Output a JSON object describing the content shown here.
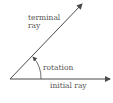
{
  "diagram": {
    "labels": {
      "terminal_line1": "terminal",
      "terminal_line2": "ray",
      "rotation": "rotation",
      "initial": "initial ray"
    },
    "colors": {
      "line": "#4a4a4a",
      "text": "#555555"
    }
  }
}
